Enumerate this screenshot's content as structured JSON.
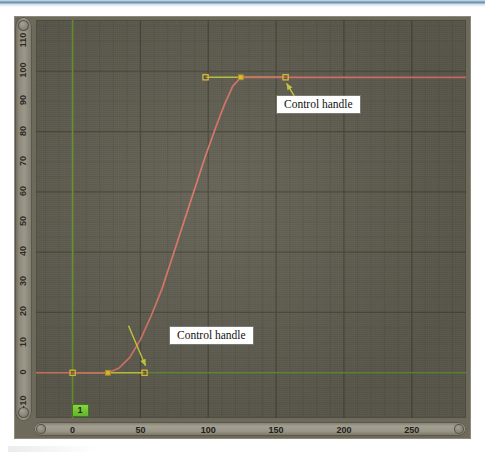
{
  "app": {
    "panel_name": "graph-editor",
    "frame_badge": "1"
  },
  "annotations": [
    {
      "id": "control-handle-top",
      "label": "Control handle"
    },
    {
      "id": "control-handle-bottom",
      "label": "Control handle"
    }
  ],
  "colors": {
    "canvas_bg": "#615e51",
    "grid_minor": "#595647",
    "grid_major": "#4b4839",
    "curve": "#d9766b",
    "handle_line": "#c9cc3f",
    "handle_point": "#e8c33a",
    "axis_green": "#6d9c33",
    "badge_green": "#7ecb3a",
    "ruler": "#9b9889",
    "callout_bg": "#ffffff",
    "callout_text": "#111111"
  },
  "chart_data": {
    "type": "line",
    "title": "",
    "xlabel": "",
    "ylabel": "",
    "xlim": [
      -27,
      290
    ],
    "ylim": [
      -15,
      117
    ],
    "grid": true,
    "legend": "none",
    "x_ticks": [
      0,
      50,
      100,
      150,
      200,
      250
    ],
    "x_tick_labels": [
      "0",
      "50",
      "100",
      "150",
      "200",
      "250"
    ],
    "y_ticks": [
      -10,
      0,
      10,
      20,
      30,
      40,
      50,
      60,
      70,
      80,
      90,
      100,
      110
    ],
    "y_tick_labels": [
      "-10",
      "0",
      "10",
      "20",
      "30",
      "40",
      "50",
      "60",
      "70",
      "80",
      "90",
      "100",
      "110"
    ],
    "series": [
      {
        "name": "animation-curve",
        "color": "#d9766b",
        "keyframes": [
          {
            "x": 26,
            "y": 0
          },
          {
            "x": 124,
            "y": 98
          }
        ],
        "points": [
          {
            "x": -27,
            "y": 0
          },
          {
            "x": 0,
            "y": 0
          },
          {
            "x": 26,
            "y": 0
          },
          {
            "x": 34,
            "y": 1.5
          },
          {
            "x": 42,
            "y": 5
          },
          {
            "x": 50,
            "y": 11
          },
          {
            "x": 58,
            "y": 19
          },
          {
            "x": 66,
            "y": 28
          },
          {
            "x": 74,
            "y": 39
          },
          {
            "x": 82,
            "y": 50
          },
          {
            "x": 90,
            "y": 61
          },
          {
            "x": 98,
            "y": 72
          },
          {
            "x": 106,
            "y": 82
          },
          {
            "x": 112,
            "y": 89
          },
          {
            "x": 118,
            "y": 95
          },
          {
            "x": 124,
            "y": 98
          },
          {
            "x": 140,
            "y": 98
          },
          {
            "x": 200,
            "y": 98
          },
          {
            "x": 290,
            "y": 98
          }
        ]
      }
    ],
    "control_handles": [
      {
        "keyframe": 0,
        "side": "in",
        "x": 0,
        "y": 0
      },
      {
        "keyframe": 0,
        "side": "out",
        "x": 53,
        "y": 0
      },
      {
        "keyframe": 1,
        "side": "in",
        "x": 98,
        "y": 98
      },
      {
        "keyframe": 1,
        "side": "out",
        "x": 157,
        "y": 98
      }
    ],
    "markers": [
      {
        "name": "current-frame",
        "x": 0,
        "label": "1"
      },
      {
        "name": "value-zero-line",
        "y": 0
      }
    ]
  }
}
